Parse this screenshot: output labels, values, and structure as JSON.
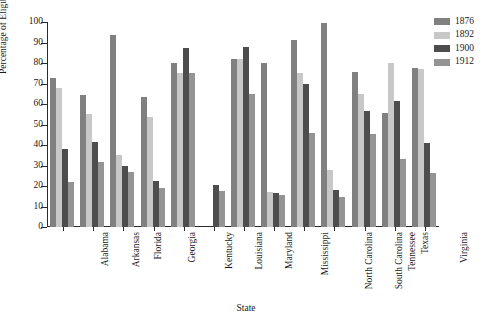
{
  "chart_data": {
    "type": "bar",
    "title": "",
    "xlabel": "State",
    "ylabel": "Percentage of Eligible Voters",
    "ylim": [
      0,
      100
    ],
    "yticks": [
      0,
      10,
      20,
      30,
      40,
      50,
      60,
      70,
      80,
      90,
      100
    ],
    "grid": false,
    "legend_position": "top-right",
    "categories": [
      "Alabama",
      "Arkansas",
      "Florida",
      "Georgia",
      "Kentucky",
      "Louisiana",
      "Maryland",
      "Mississippi",
      "North Carolina",
      "South Carolina",
      "Tennessee",
      "Texas",
      "Virginia"
    ],
    "series": [
      {
        "name": "1876",
        "color": "#808080",
        "values": [
          72.7,
          64.3,
          93.5,
          63.5,
          79.8,
          0,
          82.0,
          79.8,
          91.0,
          99.5,
          75.8,
          55.5,
          77.5
        ]
      },
      {
        "name": "1892",
        "color": "#c8c8c8",
        "values": [
          67.8,
          55.0,
          35.0,
          53.5,
          75.3,
          0,
          82.0,
          17.0,
          75.0,
          28.0,
          65.0,
          79.8,
          77.0
        ]
      },
      {
        "name": "1900",
        "color": "#4d4d4d",
        "values": [
          38.0,
          41.5,
          30.0,
          22.5,
          87.5,
          20.5,
          88.0,
          16.5,
          70.0,
          18.0,
          56.5,
          61.5,
          41.0
        ]
      },
      {
        "name": "1912",
        "color": "#949494",
        "values": [
          22.0,
          31.5,
          27.0,
          19.0,
          75.0,
          17.5,
          65.0,
          15.5,
          45.8,
          14.5,
          45.5,
          33.0,
          26.5
        ]
      }
    ]
  }
}
